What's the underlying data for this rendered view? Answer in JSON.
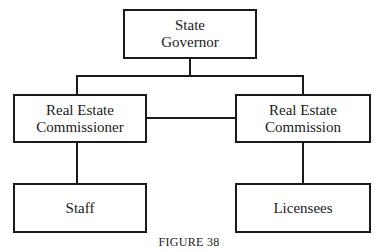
{
  "diagram": {
    "type": "org-chart",
    "nodes": {
      "governor": {
        "line1": "State",
        "line2": "Governor"
      },
      "commissioner": {
        "line1": "Real Estate",
        "line2": "Commissioner"
      },
      "commission": {
        "line1": "Real Estate",
        "line2": "Commission"
      },
      "staff": {
        "label": "Staff"
      },
      "licensees": {
        "label": "Licensees"
      }
    },
    "edges": [
      [
        "governor",
        "commissioner"
      ],
      [
        "governor",
        "commission"
      ],
      [
        "commissioner",
        "commission"
      ],
      [
        "commissioner",
        "staff"
      ],
      [
        "commission",
        "licensees"
      ]
    ],
    "caption": "FIGURE 38"
  }
}
